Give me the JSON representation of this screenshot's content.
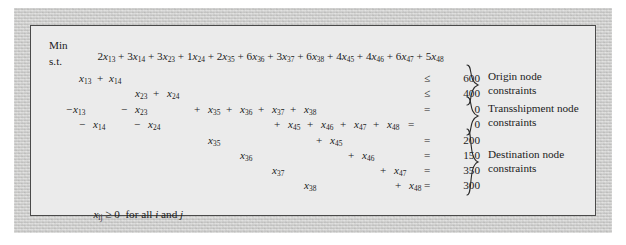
{
  "figure": {
    "kind": "linear-programming-formulation",
    "problem_type": "transshipment problem",
    "panel_background": "#ebebeb",
    "mat_background": "#d8d8d6",
    "border_color": "#4a4a4a",
    "text_color": "#1b1b1b"
  },
  "objective": {
    "keyword": "Min",
    "expression_terms": [
      "2x13",
      "3x14",
      "3x23",
      "1x24",
      "2x35",
      "6x36",
      "3x37",
      "6x38",
      "4x45",
      "4x46",
      "6x47",
      "5x48"
    ],
    "terms": [
      {
        "coef": "2",
        "var": "x",
        "sub": "13",
        "op": ""
      },
      {
        "coef": "3",
        "var": "x",
        "sub": "14",
        "op": "+"
      },
      {
        "coef": "3",
        "var": "x",
        "sub": "23",
        "op": "+"
      },
      {
        "coef": "1",
        "var": "x",
        "sub": "24",
        "op": "+"
      },
      {
        "coef": "2",
        "var": "x",
        "sub": "35",
        "op": "+"
      },
      {
        "coef": "6",
        "var": "x",
        "sub": "36",
        "op": "+"
      },
      {
        "coef": "3",
        "var": "x",
        "sub": "37",
        "op": "+"
      },
      {
        "coef": "6",
        "var": "x",
        "sub": "38",
        "op": "+"
      },
      {
        "coef": "4",
        "var": "x",
        "sub": "45",
        "op": "+"
      },
      {
        "coef": "4",
        "var": "x",
        "sub": "46",
        "op": "+"
      },
      {
        "coef": "6",
        "var": "x",
        "sub": "47",
        "op": "+"
      },
      {
        "coef": "5",
        "var": "x",
        "sub": "48",
        "op": "+"
      }
    ]
  },
  "subject_to_label": "s.t.",
  "constraint_rows": [
    {
      "id": "origin-1",
      "group": "origin",
      "terms": [
        {
          "op": "",
          "var": "x",
          "sub": "13"
        },
        {
          "op": "+",
          "var": "x",
          "sub": "14"
        }
      ],
      "relation": "≤",
      "rhs": "600"
    },
    {
      "id": "origin-2",
      "group": "origin",
      "terms": [
        {
          "op": "",
          "var": "x",
          "sub": "23"
        },
        {
          "op": "+",
          "var": "x",
          "sub": "24"
        }
      ],
      "relation": "≤",
      "rhs": "400"
    },
    {
      "id": "transshipment-1",
      "group": "transshipment",
      "terms": [
        {
          "op": "−",
          "var": "x",
          "sub": "13"
        },
        {
          "op": "−",
          "var": "x",
          "sub": "23"
        },
        {
          "op": "+",
          "var": "x",
          "sub": "35"
        },
        {
          "op": "+",
          "var": "x",
          "sub": "36"
        },
        {
          "op": "+",
          "var": "x",
          "sub": "37"
        },
        {
          "op": "+",
          "var": "x",
          "sub": "38"
        }
      ],
      "relation": "=",
      "rhs": "0"
    },
    {
      "id": "transshipment-2",
      "group": "transshipment",
      "terms": [
        {
          "op": "−",
          "var": "x",
          "sub": "14"
        },
        {
          "op": "−",
          "var": "x",
          "sub": "24"
        },
        {
          "op": "+",
          "var": "x",
          "sub": "45"
        },
        {
          "op": "+",
          "var": "x",
          "sub": "46"
        },
        {
          "op": "+",
          "var": "x",
          "sub": "47"
        },
        {
          "op": "+",
          "var": "x",
          "sub": "48"
        }
      ],
      "relation": "=",
      "rhs": "0"
    },
    {
      "id": "destination-1",
      "group": "destination",
      "terms": [
        {
          "op": "",
          "var": "x",
          "sub": "35"
        },
        {
          "op": "+",
          "var": "x",
          "sub": "45"
        }
      ],
      "relation": "=",
      "rhs": "200"
    },
    {
      "id": "destination-2",
      "group": "destination",
      "terms": [
        {
          "op": "",
          "var": "x",
          "sub": "36"
        },
        {
          "op": "+",
          "var": "x",
          "sub": "46"
        }
      ],
      "relation": "=",
      "rhs": "150"
    },
    {
      "id": "destination-3",
      "group": "destination",
      "terms": [
        {
          "op": "",
          "var": "x",
          "sub": "37"
        },
        {
          "op": "+",
          "var": "x",
          "sub": "47"
        }
      ],
      "relation": "=",
      "rhs": "350"
    },
    {
      "id": "destination-4",
      "group": "destination",
      "terms": [
        {
          "op": "",
          "var": "x",
          "sub": "38"
        },
        {
          "op": "+",
          "var": "x",
          "sub": "48"
        }
      ],
      "relation": "=",
      "rhs": "300"
    }
  ],
  "group_labels": [
    {
      "id": "origin",
      "text": "Origin node\nconstraints"
    },
    {
      "id": "transshipment",
      "text": "Transshipment node\nconstraints"
    },
    {
      "id": "destination",
      "text": "Destination node\nconstraints"
    }
  ],
  "nonnegativity": {
    "var": "x",
    "sub": "ij",
    "relation": "≥",
    "value": "0",
    "qualifier_pre": "for all ",
    "index_i": "i",
    "qualifier_mid": " and ",
    "index_j": "j"
  },
  "tokens": {
    "objective_keyword": "Min",
    "st": "s.t.",
    "plus": "+",
    "minus": "−",
    "eq": "=",
    "leq": "≤",
    "geq": "≥",
    "zero": "0"
  }
}
